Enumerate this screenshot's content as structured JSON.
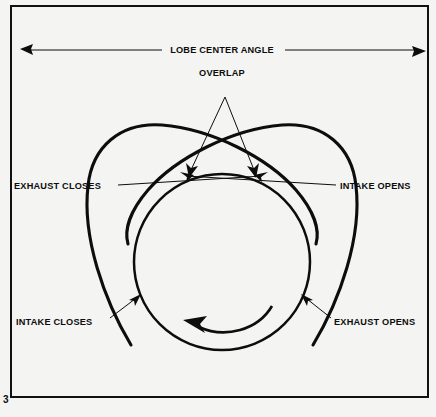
{
  "figure": {
    "page_number": "3",
    "background_color": "#f4f4f2",
    "ink_color": "#0d0d0d",
    "labels": {
      "lobe_center_angle": "LOBE CENTER ANGLE",
      "overlap": "OVERLAP",
      "exhaust_closes": "EXHAUST CLOSES",
      "intake_opens": "INTAKE OPENS",
      "intake_closes": "INTAKE CLOSES",
      "exhaust_opens": "EXHAUST OPENS"
    },
    "icons": {
      "rotation_arrow": "counterclockwise-rotation-arrow",
      "dimension_arrow_left": "arrow-left",
      "dimension_arrow_right": "arrow-right",
      "overlap_arrow_left": "arrow-down-left",
      "overlap_arrow_right": "arrow-down-right",
      "leader_arrow_intake_closes": "arrow-up-right",
      "leader_arrow_exhaust_opens": "arrow-up-left"
    },
    "geometry": {
      "base_circle": {
        "cx": 222,
        "cy": 262,
        "r": 88
      },
      "lobe_left_tip": {
        "x": 92,
        "y": 128
      },
      "lobe_right_tip": {
        "x": 352,
        "y": 128
      },
      "centerline_crossing": {
        "x": 221,
        "y": 262
      },
      "overlap_apex": {
        "x": 225,
        "y": 97
      },
      "overlap_point_left": {
        "x": 193,
        "y": 175
      },
      "overlap_point_right": {
        "x": 252,
        "y": 175
      }
    }
  }
}
